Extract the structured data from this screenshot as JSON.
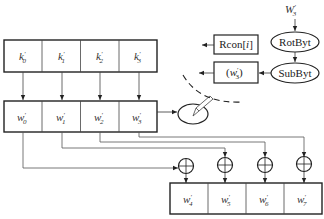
{
  "diagram": {
    "type": "AES key expansion round",
    "top_row": {
      "cells": [
        {
          "base": "k",
          "prime": "′",
          "sub": "0"
        },
        {
          "base": "k",
          "prime": "′",
          "sub": "1"
        },
        {
          "base": "k",
          "prime": "′",
          "sub": "2"
        },
        {
          "base": "k",
          "prime": "′",
          "sub": "3"
        }
      ]
    },
    "middle_row": {
      "cells": [
        {
          "base": "w",
          "prime": "′",
          "sub": "0"
        },
        {
          "base": "w",
          "prime": "′",
          "sub": "1"
        },
        {
          "base": "w",
          "prime": "′",
          "sub": "2"
        },
        {
          "base": "w",
          "prime": "′",
          "sub": "3"
        }
      ]
    },
    "bottom_row": {
      "cells": [
        {
          "base": "w",
          "prime": "′",
          "sub": "4"
        },
        {
          "base": "w",
          "prime": "′",
          "sub": "5"
        },
        {
          "base": "w",
          "prime": "′",
          "sub": "6"
        },
        {
          "base": "w",
          "prime": "′",
          "sub": "7"
        }
      ]
    },
    "input_label": {
      "base": "W",
      "prime": "′",
      "sub": "3"
    },
    "rotbyt_label": "RotByt",
    "subbyt_label": "SubByt",
    "rcon_label": "Rcon[i]",
    "rcon_prefix": "Rcon[",
    "rcon_index": "i",
    "rcon_suffix": "]",
    "w3_box": {
      "open": "(",
      "base": "w",
      "prime": "′",
      "sub": "3",
      "close": ")"
    },
    "xor_symbol": "⊕",
    "colors": {
      "line": "#333333",
      "box_border": "#222222",
      "wire": "#555555"
    }
  }
}
